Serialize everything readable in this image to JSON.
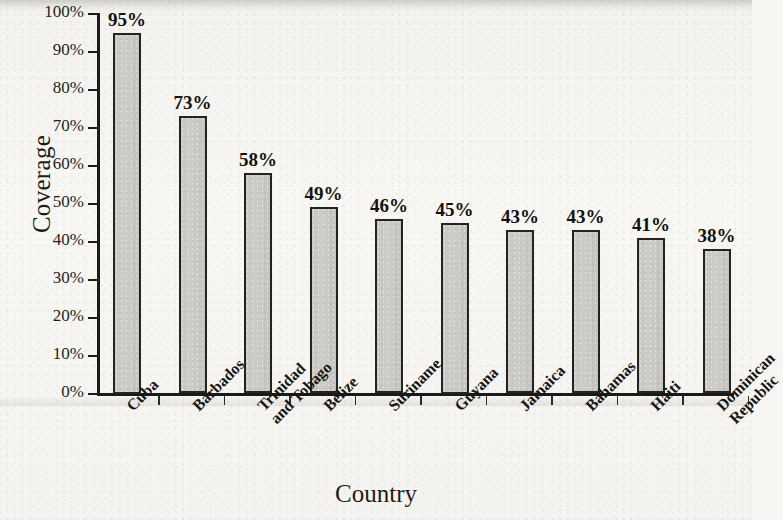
{
  "chart_data": {
    "type": "bar",
    "title": "",
    "xlabel": "Country",
    "ylabel": "Coverage",
    "categories": [
      "Cuba",
      "Barbados",
      "Trinidad and Tobago",
      "Belize",
      "Suriname",
      "Guyana",
      "Jamaica",
      "Bahamas",
      "Haiti",
      "Dominican Republic"
    ],
    "category_lines": [
      [
        "Cuba"
      ],
      [
        "Barbados"
      ],
      [
        "Trinidad",
        "and Tobago"
      ],
      [
        "Belize"
      ],
      [
        "Suriname"
      ],
      [
        "Guyana"
      ],
      [
        "Jamaica"
      ],
      [
        "Bahamas"
      ],
      [
        "Haiti"
      ],
      [
        "Dominican",
        "Republic"
      ]
    ],
    "values": [
      95,
      73,
      58,
      49,
      46,
      45,
      43,
      43,
      41,
      38
    ],
    "value_labels": [
      "95%",
      "73%",
      "58%",
      "49%",
      "46%",
      "45%",
      "43%",
      "43%",
      "41%",
      "38%"
    ],
    "ylim": [
      0,
      100
    ],
    "ytick_values": [
      0,
      10,
      20,
      30,
      40,
      50,
      60,
      70,
      80,
      90,
      100
    ],
    "ytick_labels": [
      "0%",
      "10%",
      "20%",
      "30%",
      "40%",
      "50%",
      "60%",
      "70%",
      "80%",
      "90%",
      "100%"
    ],
    "grid": false,
    "legend": false,
    "bar_color": "#c9c8c4",
    "bar_edge_color": "#232321",
    "axis_color": "#1a1a18",
    "background_color": "#f7f6f3"
  }
}
